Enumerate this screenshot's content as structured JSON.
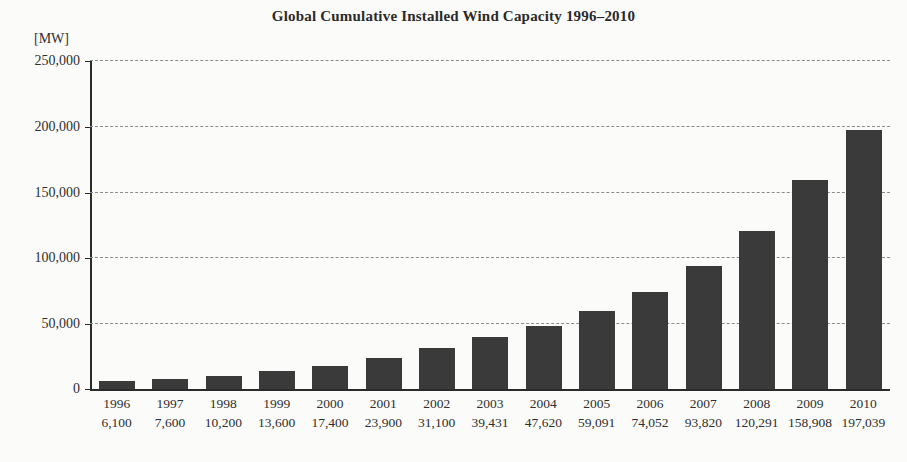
{
  "chart_data": {
    "type": "bar",
    "title": "Global Cumulative Installed Wind Capacity 1996–2010",
    "xlabel": "",
    "ylabel": "[MW]",
    "ylim": [
      0,
      250000
    ],
    "grid": true,
    "legend": "none",
    "y_unit_label": "[MW]",
    "y_ticks": [
      0,
      50000,
      100000,
      150000,
      200000,
      250000
    ],
    "y_tick_labels": [
      "0",
      "50,000",
      "100,000",
      "150,000",
      "200,000",
      "250,000"
    ],
    "categories": [
      "1996",
      "1997",
      "1998",
      "1999",
      "2000",
      "2001",
      "2002",
      "2003",
      "2004",
      "2005",
      "2006",
      "2007",
      "2008",
      "2009",
      "2010"
    ],
    "values": [
      6100,
      7600,
      10200,
      13600,
      17400,
      23900,
      31100,
      39431,
      47620,
      59091,
      74052,
      93820,
      120291,
      158908,
      197039
    ],
    "value_labels": [
      "6,100",
      "7,600",
      "10,200",
      "13,600",
      "17,400",
      "23,900",
      "31,100",
      "39,431",
      "47,620",
      "59,091",
      "74,052",
      "93,820",
      "120,291",
      "158,908",
      "197,039"
    ],
    "series": [
      {
        "name": "Cumulative installed wind capacity",
        "values": [
          6100,
          7600,
          10200,
          13600,
          17400,
          23900,
          31100,
          39431,
          47620,
          59091,
          74052,
          93820,
          120291,
          158908,
          197039
        ]
      }
    ],
    "bar_color": "#3a3a3a",
    "grid_color": "#8c8c8c",
    "axis_color": "#2b2b2b",
    "background_color": "#fbfbf9"
  }
}
